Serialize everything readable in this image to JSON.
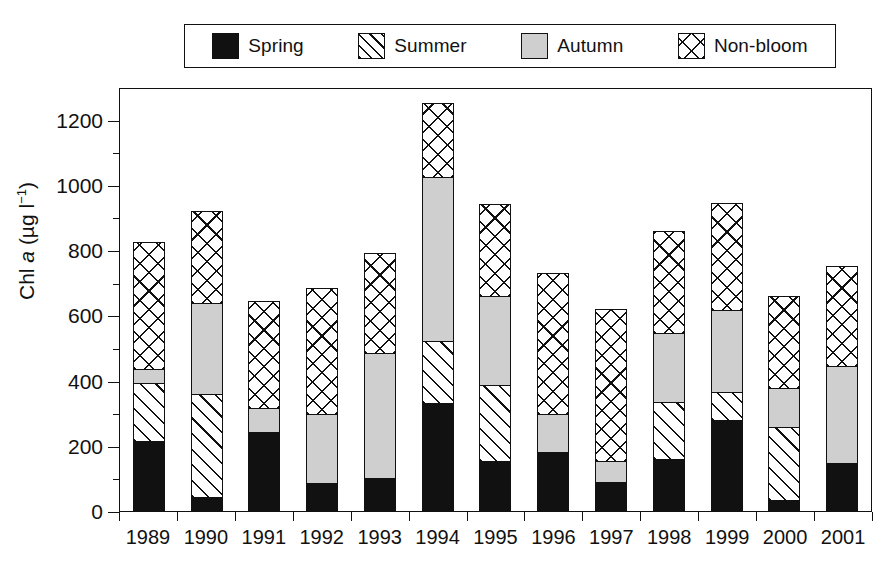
{
  "chart_data": {
    "type": "bar",
    "stacked": true,
    "title": "",
    "xlabel": "",
    "ylabel": "Chl a (µg l⁻¹)",
    "ylim": [
      0,
      1300
    ],
    "ytick_values": [
      0,
      200,
      400,
      600,
      800,
      1000,
      1200
    ],
    "ytick_labels": [
      "0",
      "200",
      "400",
      "600",
      "800",
      "1000",
      "1200"
    ],
    "yminor_step": 100,
    "grid": false,
    "legend_position": "top",
    "categories": [
      "1989",
      "1990",
      "1991",
      "1992",
      "1993",
      "1994",
      "1995",
      "1996",
      "1997",
      "1998",
      "1999",
      "2000",
      "2001"
    ],
    "series": [
      {
        "name": "Spring",
        "pattern": "solid-black",
        "values": [
          215,
          42,
          243,
          86,
          102,
          330,
          152,
          180,
          88,
          160,
          278,
          35,
          148
        ]
      },
      {
        "name": "Summer",
        "pattern": "diagonal-hatch",
        "values": [
          177,
          318,
          0,
          0,
          0,
          190,
          233,
          0,
          0,
          175,
          87,
          223,
          0
        ]
      },
      {
        "name": "Autumn",
        "pattern": "solid-grey",
        "values": [
          43,
          277,
          74,
          211,
          383,
          505,
          275,
          118,
          64,
          210,
          250,
          120,
          297
        ]
      },
      {
        "name": "Non-bloom",
        "pattern": "cross-hatch",
        "values": [
          390,
          283,
          328,
          388,
          305,
          225,
          280,
          432,
          466,
          315,
          330,
          282,
          307
        ]
      }
    ],
    "totals": [
      825,
      920,
      645,
      685,
      790,
      1250,
      940,
      730,
      618,
      860,
      945,
      660,
      752
    ]
  },
  "legend": {
    "entries": [
      {
        "label": "Spring",
        "icon": "solid-black-swatch"
      },
      {
        "label": "Summer",
        "icon": "diagonal-hatch-swatch"
      },
      {
        "label": "Autumn",
        "icon": "solid-grey-swatch"
      },
      {
        "label": "Non-bloom",
        "icon": "cross-hatch-swatch"
      }
    ]
  },
  "colors": {
    "axis": "#111111",
    "spring": "#111111",
    "summer": "#ffffff",
    "autumn": "#cfcfcf",
    "nonbloom": "#ffffff",
    "background": "#ffffff"
  }
}
